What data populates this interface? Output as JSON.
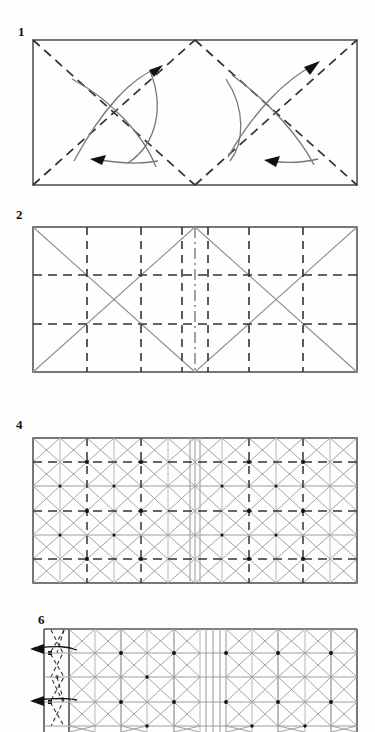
{
  "document": {
    "kind": "origami-crease-pattern-instructions",
    "background_color": "#ffffff",
    "ink_color": "#1a1a1a",
    "faint_ink_color": "#8a8a8a",
    "page_width": 375,
    "page_height": 732
  },
  "steps": [
    {
      "number": "1",
      "label_x": 18,
      "label_y": 25,
      "frame": {
        "x": 32,
        "y": 39,
        "w": 326,
        "h": 147
      },
      "caption": "Fold both diagonals of each half square",
      "line_style": "dashed-diagonals-with-curved-arrows",
      "grid": {
        "cols": 2,
        "rows": 1
      },
      "arrows": [
        {
          "name": "arrow-upper-left",
          "direction": "up-left"
        },
        {
          "name": "arrow-lower-left",
          "direction": "down-left"
        },
        {
          "name": "arrow-upper-right",
          "direction": "up-right"
        },
        {
          "name": "arrow-lower-right",
          "direction": "down-right"
        }
      ]
    },
    {
      "number": "2",
      "label_x": 16,
      "label_y": 208,
      "frame": {
        "x": 32,
        "y": 226,
        "w": 326,
        "h": 147
      },
      "caption": "Divide each half into thirds both ways",
      "line_style": "dashed-thirds-grid-with-diagonals",
      "grid": {
        "cols": 6,
        "rows": 3
      },
      "center_line": "dash-dot"
    },
    {
      "number": "4",
      "label_x": 16,
      "label_y": 418,
      "frame": {
        "x": 32,
        "y": 437,
        "w": 326,
        "h": 147
      },
      "caption": "Complete grid with diagonals in every cell",
      "line_style": "full-grid-with-diagonals",
      "grid": {
        "cols": 12,
        "rows": 6
      },
      "center_line": "solid"
    },
    {
      "number": "6",
      "label_x": 38,
      "label_y": 613,
      "frame": {
        "x": 43,
        "y": 628,
        "w": 315,
        "h": 120
      },
      "caption": "Collapse the left edge column",
      "line_style": "grid-with-left-pleat-column",
      "grid": {
        "cols": 12,
        "rows": 6
      },
      "cropped_at_bottom": true,
      "arrows": [
        {
          "name": "arrow-pleat-upper",
          "direction": "left"
        },
        {
          "name": "arrow-pleat-lower",
          "direction": "left"
        }
      ]
    }
  ]
}
